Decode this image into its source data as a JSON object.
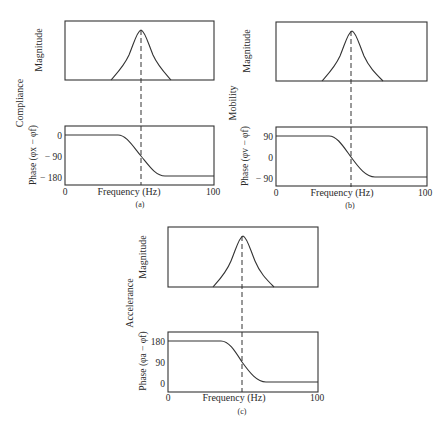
{
  "figure": {
    "panels": [
      {
        "id": "a",
        "caption": "(a)",
        "quantity": "Compliance",
        "magnitude_label": "Magnitude",
        "phase_label": "Phase (φx − φf)",
        "phase_ticks": [
          "0",
          "− 90",
          "− 180"
        ],
        "x_label": "Frequency (Hz)",
        "x_ticks": [
          "0",
          "100"
        ]
      },
      {
        "id": "b",
        "caption": "(b)",
        "quantity": "Mobility",
        "magnitude_label": "Magnitude",
        "phase_label": "Phase (φv − φf)",
        "phase_ticks": [
          "90",
          "0",
          "− 90"
        ],
        "x_label": "Frequency (Hz)",
        "x_ticks": [
          "0",
          "100"
        ]
      },
      {
        "id": "c",
        "caption": "(c)",
        "quantity": "Accelerance",
        "magnitude_label": "Magnitude",
        "phase_label": "Phase (φa − φf)",
        "phase_ticks": [
          "180",
          "90",
          "0"
        ],
        "x_label": "Frequency (Hz)",
        "x_ticks": [
          "0",
          "100"
        ]
      }
    ],
    "colors": {
      "ink": "#333333",
      "background": "#ffffff"
    }
  }
}
